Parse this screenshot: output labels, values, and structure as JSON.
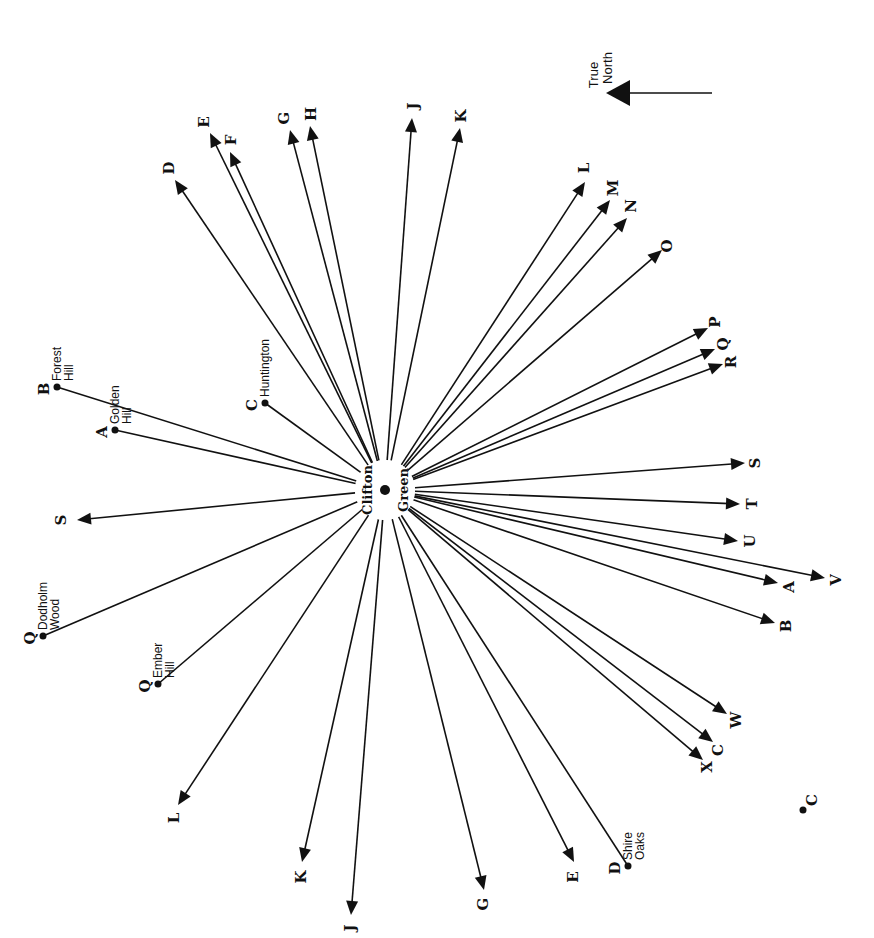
{
  "diagram": {
    "center": {
      "label_line1": "Clifton",
      "label_line2": "Green",
      "x": 385,
      "y": 490
    },
    "north_indicator": {
      "line1": "True",
      "line2": "North",
      "arrow_from": [
        712,
        93
      ],
      "arrow_to": [
        606,
        93
      ]
    },
    "outgoing_rays": [
      {
        "letter": "D",
        "to": [
          175,
          180
        ],
        "label_at": [
          170,
          168
        ]
      },
      {
        "letter": "E",
        "to": [
          210,
          133
        ],
        "label_at": [
          205,
          122
        ]
      },
      {
        "letter": "F",
        "to": [
          230,
          152
        ],
        "label_at": [
          232,
          140
        ]
      },
      {
        "letter": "G",
        "to": [
          290,
          130
        ],
        "label_at": [
          285,
          118
        ]
      },
      {
        "letter": "H",
        "to": [
          310,
          126
        ],
        "label_at": [
          312,
          114
        ]
      },
      {
        "letter": "J",
        "to": [
          412,
          118
        ],
        "label_at": [
          414,
          106
        ]
      },
      {
        "letter": "K",
        "to": [
          460,
          128
        ],
        "label_at": [
          462,
          116
        ]
      },
      {
        "letter": "L",
        "to": [
          585,
          182
        ],
        "label_at": [
          585,
          168
        ]
      },
      {
        "letter": "M",
        "to": [
          610,
          200
        ],
        "label_at": [
          614,
          188
        ]
      },
      {
        "letter": "N",
        "to": [
          627,
          218
        ],
        "label_at": [
          632,
          206
        ]
      },
      {
        "letter": "O",
        "to": [
          662,
          250
        ],
        "label_at": [
          668,
          246
        ]
      },
      {
        "letter": "P",
        "to": [
          708,
          328
        ],
        "label_at": [
          716,
          322
        ]
      },
      {
        "letter": "Q",
        "to": [
          715,
          349
        ],
        "label_at": [
          724,
          344
        ]
      },
      {
        "letter": "R",
        "to": [
          723,
          364
        ],
        "label_at": [
          732,
          362
        ]
      },
      {
        "letter": "S",
        "to": [
          745,
          463
        ],
        "label_at": [
          756,
          463
        ]
      },
      {
        "letter": "T",
        "to": [
          740,
          504
        ],
        "label_at": [
          753,
          504
        ]
      },
      {
        "letter": "U",
        "to": [
          738,
          541
        ],
        "label_at": [
          751,
          541
        ]
      },
      {
        "letter": "V",
        "to": [
          825,
          578
        ],
        "label_at": [
          837,
          580
        ]
      },
      {
        "letter": "A",
        "to": [
          778,
          583
        ],
        "label_at": [
          790,
          587
        ]
      },
      {
        "letter": "B",
        "to": [
          775,
          623
        ],
        "label_at": [
          787,
          626
        ]
      },
      {
        "letter": "W",
        "to": [
          727,
          714
        ],
        "label_at": [
          737,
          720
        ]
      },
      {
        "letter": "C",
        "to": [
          713,
          742
        ],
        "label_at": [
          719,
          750
        ]
      },
      {
        "letter": "X",
        "to": [
          703,
          760
        ],
        "label_at": [
          708,
          767
        ]
      },
      {
        "letter": "E",
        "to": [
          574,
          862
        ],
        "label_at": [
          574,
          877
        ]
      },
      {
        "letter": "G",
        "to": [
          484,
          890
        ],
        "label_at": [
          484,
          904
        ]
      },
      {
        "letter": "J",
        "to": [
          351,
          915
        ],
        "label_at": [
          351,
          928
        ]
      },
      {
        "letter": "K",
        "to": [
          302,
          862
        ],
        "label_at": [
          302,
          877
        ]
      },
      {
        "letter": "L",
        "to": [
          178,
          805
        ],
        "label_at": [
          175,
          818
        ]
      },
      {
        "letter": "S",
        "to": [
          77,
          520
        ],
        "label_at": [
          62,
          520
        ]
      }
    ],
    "incoming_points": [
      {
        "letter": "B",
        "place_line1": "Forest",
        "place_line2": "Hill",
        "at": [
          57,
          387
        ]
      },
      {
        "letter": "A",
        "place_line1": "Golden",
        "place_line2": "Hill",
        "at": [
          115,
          430
        ]
      },
      {
        "letter": "C",
        "place_line1": "Huntington",
        "place_line2": "",
        "at": [
          265,
          403
        ]
      },
      {
        "letter": "Q",
        "place_line1": "Dodholm",
        "place_line2": "Wood",
        "at": [
          43,
          636
        ]
      },
      {
        "letter": "Q",
        "place_line1": "Ember",
        "place_line2": "Hill",
        "at": [
          158,
          684
        ]
      },
      {
        "letter": "D",
        "place_line1": "Shire",
        "place_line2": "Oaks",
        "at": [
          628,
          866
        ]
      }
    ],
    "isolated_points": [
      {
        "letter": "C",
        "at": [
          803,
          810
        ]
      }
    ],
    "colors": {
      "ink": "#111111",
      "paper": "#ffffff"
    }
  }
}
